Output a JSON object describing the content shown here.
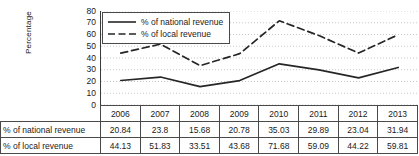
{
  "chart_data": {
    "type": "line",
    "title": "",
    "xlabel": "",
    "ylabel": "Percentage",
    "ylim": [
      0,
      80
    ],
    "ytick_step": 10,
    "yticks": [
      80,
      70,
      60,
      50,
      40,
      30,
      20,
      10,
      0
    ],
    "grid": true,
    "grid_axis": "y",
    "grid_style": "dotted",
    "legend_position": "top-left",
    "categories": [
      "2006",
      "2007",
      "2008",
      "2009",
      "2010",
      "2011",
      "2012",
      "2013"
    ],
    "series": [
      {
        "name": "% of national revenue",
        "style": "solid",
        "color": "#262626",
        "values": [
          20.84,
          23.8,
          15.68,
          20.78,
          35.03,
          29.89,
          23.04,
          31.94
        ]
      },
      {
        "name": "% of local revenue",
        "style": "dashed",
        "color": "#262626",
        "values": [
          44.13,
          51.83,
          33.51,
          43.68,
          71.68,
          59.09,
          44.22,
          59.81
        ]
      }
    ]
  },
  "legend": {
    "items": [
      {
        "label": "% of national revenue",
        "style": "solid"
      },
      {
        "label": "% of local revenue",
        "style": "dashed"
      }
    ]
  },
  "axis": {
    "y_title": "Percentage",
    "y_tick_labels": [
      "80",
      "70",
      "60",
      "50",
      "40",
      "30",
      "20",
      "10",
      "0"
    ]
  },
  "table": {
    "corner_label": "",
    "header": [
      "2006",
      "2007",
      "2008",
      "2009",
      "2010",
      "2011",
      "2012",
      "2013"
    ],
    "rows": [
      {
        "label": "% of national revenue",
        "values": [
          "20.84",
          "23.8",
          "15.68",
          "20.78",
          "35.03",
          "29.89",
          "23.04",
          "31.94"
        ]
      },
      {
        "label": "% of local revenue",
        "values": [
          "44.13",
          "51.83",
          "33.51",
          "43.68",
          "71.68",
          "59.09",
          "44.22",
          "59.81"
        ]
      }
    ]
  },
  "colors": {
    "line": "#262626",
    "axis": "#3a3a3a",
    "grid": "#c9c9c9",
    "border": "#4a4a4a",
    "background": "#ffffff"
  }
}
